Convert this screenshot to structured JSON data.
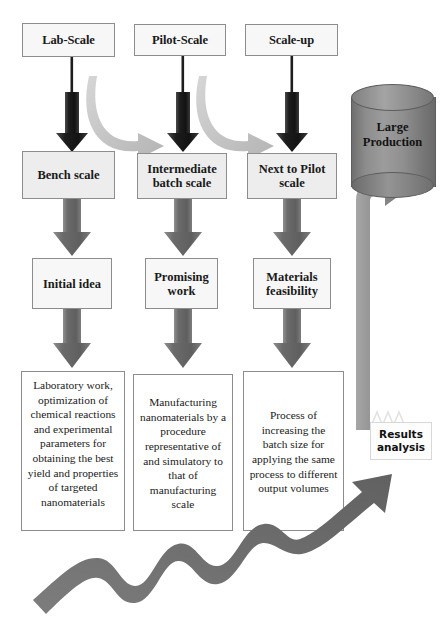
{
  "diagram": {
    "colors": {
      "dark_arrow": "#2b2b2b",
      "gray_arrow": "#6f6f6f",
      "light_curve_arrow": "#c9c9c9",
      "cylinder": "#8a8a8a",
      "box_border": "#8d8d8d",
      "box_fill_light": "#f7f7f7",
      "box_fill_gray": "#ededed",
      "background": "#ffffff"
    },
    "columns": [
      {
        "key": "lab",
        "stage": "Lab-Scale",
        "level2": "Bench scale",
        "level3": "Initial idea",
        "description": "Laboratory work, optimization of chemical reactions and experimental parameters for obtaining the best yield and properties of targeted nanomaterials"
      },
      {
        "key": "pilot",
        "stage": "Pilot-Scale",
        "level2": "Intermediate batch scale",
        "level3": "Promising work",
        "description": "Manufacturing nanomaterials by a procedure representative of and simulatory to that of manufacturing scale"
      },
      {
        "key": "scaleup",
        "stage": "Scale-up",
        "level2": "Next to Pilot scale",
        "level3": "Materials feasibility",
        "description": "Process of increasing the batch size for applying the same process to different output volumes"
      }
    ],
    "production": {
      "label": "Large Production",
      "shape": "cylinder"
    },
    "results": {
      "label": "Results analysis",
      "icon": "factory-roof-icon"
    },
    "arrows": {
      "down_thin_label": "down-arrow-thin",
      "down_block_label": "down-arrow-block",
      "curve_label": "curved-transition-arrow",
      "hook_label": "hook-arrow-to-production",
      "wave_label": "growth-wave-arrow"
    }
  }
}
